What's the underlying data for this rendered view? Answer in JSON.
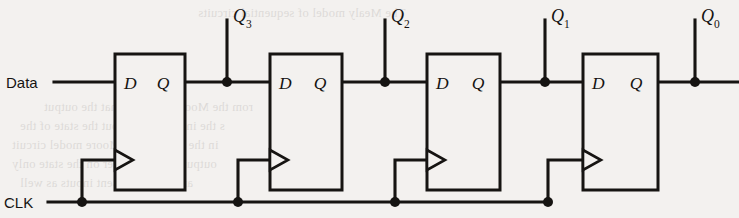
{
  "diagram": {
    "background_color": "#f3f1ef",
    "line_color": "#161412",
    "inputs": {
      "data_label": "Data",
      "clock_label": "CLK"
    },
    "flipflops": [
      {
        "id": "ff3",
        "d_label": "D",
        "q_label": "Q",
        "x": 115,
        "y": 54,
        "w": 70,
        "h": 136,
        "clock_edge": "rising"
      },
      {
        "id": "ff2",
        "d_label": "D",
        "q_label": "Q",
        "x": 270,
        "y": 54,
        "w": 72,
        "h": 136,
        "clock_edge": "rising"
      },
      {
        "id": "ff1",
        "d_label": "D",
        "q_label": "Q",
        "x": 427,
        "y": 54,
        "w": 73,
        "h": 136,
        "clock_edge": "rising"
      },
      {
        "id": "ff0",
        "d_label": "D",
        "q_label": "Q",
        "x": 583,
        "y": 54,
        "w": 75,
        "h": 136,
        "clock_edge": "rising"
      }
    ],
    "outputs": [
      {
        "id": "q3",
        "base": "Q",
        "subscript": "3",
        "tap_x": 227,
        "label_x": 233,
        "label_y": 22
      },
      {
        "id": "q2",
        "base": "Q",
        "subscript": "2",
        "tap_x": 385,
        "label_x": 391,
        "label_y": 22
      },
      {
        "id": "q1",
        "base": "Q",
        "subscript": "1",
        "tap_x": 545,
        "label_x": 551,
        "label_y": 22
      },
      {
        "id": "q0",
        "base": "Q",
        "subscript": "0",
        "tap_x": 695,
        "label_x": 701,
        "label_y": 22
      }
    ],
    "buses": {
      "data_y": 82,
      "clock_y": 202,
      "clock_taps": [
        82,
        238,
        395,
        548
      ],
      "clock_riser_top_y": 160
    },
    "bleed_lines": [
      {
        "text": "The Mealy model of sequential circuits",
        "x": 198,
        "y": 4
      },
      {
        "text": "rom the Moore model in that the output",
        "x": 44,
        "y": 98
      },
      {
        "text": "s the information about the state of the",
        "x": 20,
        "y": 117
      },
      {
        "text": "in the circuit. In a Moore model circuit",
        "x": 12,
        "y": 136
      },
      {
        "text": "output depends either on the state only",
        "x": 12,
        "y": 155
      },
      {
        "text": "and on the present inputs as well",
        "x": 20,
        "y": 174
      }
    ]
  }
}
